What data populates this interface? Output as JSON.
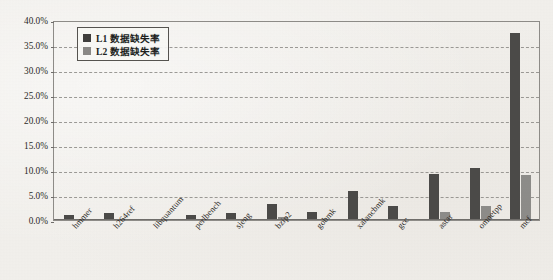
{
  "chart_data": {
    "type": "bar",
    "title": "",
    "xlabel": "",
    "ylabel": "",
    "ylim": [
      0,
      40
    ],
    "ytick_labels": [
      "40.0%",
      "35.0%",
      "30.0%",
      "25.0%",
      "20.0%",
      "15.0%",
      "10.0%",
      "5.0%",
      "0.0%"
    ],
    "ytick_values": [
      40,
      35,
      30,
      25,
      20,
      15,
      10,
      5,
      0
    ],
    "grid": true,
    "grid_style": "dashed-horizontal",
    "legend_position": "top-left",
    "categories": [
      "hmmer",
      "h264ref",
      "libquantum",
      "perlbench",
      "sjeng",
      "bzip2",
      "gobmk",
      "xalancbmk",
      "gcc",
      "astar",
      "omnetpp",
      "mcf"
    ],
    "series": [
      {
        "name": "L1 数据缺失率",
        "color": "#4b4a48",
        "values": [
          1.1,
          1.4,
          0.3,
          1.0,
          1.5,
          3.2,
          1.7,
          5.8,
          2.9,
          9.3,
          10.4,
          37.5
        ]
      },
      {
        "name": "L2 数据缺失率",
        "color": "#8d8c89",
        "values": [
          0.05,
          0.05,
          0.1,
          0.05,
          0.05,
          0.6,
          0.05,
          0.3,
          0.15,
          1.7,
          2.8,
          9.0
        ]
      }
    ]
  },
  "legend": {
    "items": [
      {
        "label": "L1 数据缺失率",
        "swatch": "legend-swatch-dark"
      },
      {
        "label": "L2 数据缺失率",
        "swatch": "legend-swatch-light"
      }
    ]
  },
  "colors": {
    "series_l1": "#4b4a48",
    "series_l2": "#8d8c89",
    "background": "#f2f0ec",
    "axis": "#6f6d6a",
    "gridline": "#8d8b87",
    "text": "#2a2825"
  }
}
